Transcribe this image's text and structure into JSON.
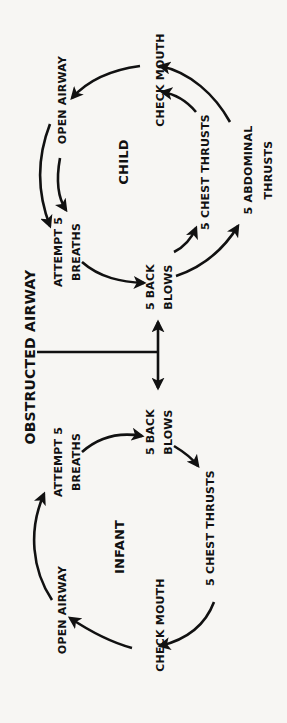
{
  "diagram": {
    "title": "OBSTRUCTED AIRWAY",
    "orientation": "rotated -90deg (text reads bottom-to-top)",
    "child": {
      "heading": "CHILD",
      "nodes": {
        "check_mouth": "CHECK MOUTH",
        "open_airway": "OPEN AIRWAY",
        "attempt_breaths_1": "ATTEMPT 5",
        "attempt_breaths_2": "BREATHS",
        "back_blows_1": "5 BACK",
        "back_blows_2": "BLOWS",
        "chest_thrusts": "5 CHEST THRUSTS",
        "abdominal_thrusts_1": "5 ABDOMINAL",
        "abdominal_thrusts_2": "THRUSTS"
      },
      "flow": [
        "OBSTRUCTED AIRWAY -> 5 BACK BLOWS",
        "5 BACK BLOWS -> 5 CHEST THRUSTS",
        "5 BACK BLOWS -> 5 ABDOMINAL THRUSTS",
        "5 CHEST THRUSTS -> CHECK MOUTH",
        "5 ABDOMINAL THRUSTS -> CHECK MOUTH",
        "CHECK MOUTH -> OPEN AIRWAY",
        "OPEN AIRWAY -> ATTEMPT 5 BREATHS",
        "ATTEMPT 5 BREATHS -> 5 BACK BLOWS"
      ]
    },
    "infant": {
      "heading": "INFANT",
      "nodes": {
        "check_mouth": "CHECK MOUTH",
        "open_airway": "OPEN AIRWAY",
        "attempt_breaths_1": "ATTEMPT 5",
        "attempt_breaths_2": "BREATHS",
        "back_blows_1": "5 BACK",
        "back_blows_2": "BLOWS",
        "chest_thrusts": "5 CHEST THRUSTS"
      },
      "flow": [
        "OBSTRUCTED AIRWAY -> 5 BACK BLOWS",
        "5 BACK BLOWS -> 5 CHEST THRUSTS",
        "5 CHEST THRUSTS -> CHECK MOUTH",
        "CHECK MOUTH -> OPEN AIRWAY",
        "OPEN AIRWAY -> ATTEMPT 5 BREATHS",
        "ATTEMPT 5 BREATHS -> 5 BACK BLOWS"
      ]
    },
    "colors": {
      "ink": "#111111",
      "background": "#f7f6f3"
    }
  }
}
